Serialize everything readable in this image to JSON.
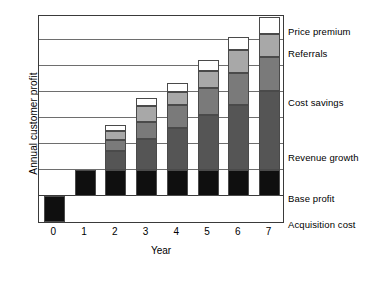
{
  "chart_data": {
    "type": "bar",
    "subtype": "stacked-bar",
    "title": "",
    "xlabel": "Year",
    "ylabel": "Annual customer profit",
    "categories": [
      "0",
      "1",
      "2",
      "3",
      "4",
      "5",
      "6",
      "7"
    ],
    "grid": true,
    "gridlines": 6,
    "ylim": [
      -1,
      7
    ],
    "legend_position": "right-inline",
    "series": [
      {
        "name": "Acquisition cost",
        "color": "#0f0f0f",
        "values": [
          -1,
          0,
          0,
          0,
          0,
          0,
          0,
          0
        ]
      },
      {
        "name": "Base profit",
        "color": "#0f0f0f",
        "values": [
          0,
          1,
          1,
          1,
          1,
          1,
          1,
          1
        ]
      },
      {
        "name": "Revenue growth",
        "color": "#555555",
        "values": [
          0,
          0,
          0.75,
          1.2,
          1.6,
          2.1,
          2.5,
          3.05
        ]
      },
      {
        "name": "Cost savings",
        "color": "#7a7a7a",
        "values": [
          0,
          0,
          0.4,
          0.65,
          0.9,
          1.05,
          1.25,
          1.3
        ]
      },
      {
        "name": "Referrals",
        "color": "#a8a8a8",
        "values": [
          0,
          0,
          0.35,
          0.6,
          0.5,
          0.65,
          0.85,
          0.9
        ]
      },
      {
        "name": "Price premium",
        "color": "#ffffff",
        "values": [
          0,
          0,
          0.22,
          0.32,
          0.35,
          0.45,
          0.5,
          0.65
        ]
      }
    ]
  },
  "axis": {
    "ylabel": "Annual customer profit",
    "xlabel": "Year",
    "xticks": [
      "0",
      "1",
      "2",
      "3",
      "4",
      "5",
      "6",
      "7"
    ]
  },
  "legend": [
    {
      "label": "Price premium",
      "color": "#ffffff"
    },
    {
      "label": "Referrals",
      "color": "#a8a8a8"
    },
    {
      "label": "Cost savings",
      "color": "#7a7a7a"
    },
    {
      "label": "Revenue growth",
      "color": "#555555"
    },
    {
      "label": "Base profit",
      "color": "#0f0f0f"
    },
    {
      "label": "Acquisition cost",
      "color": "#0f0f0f"
    }
  ]
}
